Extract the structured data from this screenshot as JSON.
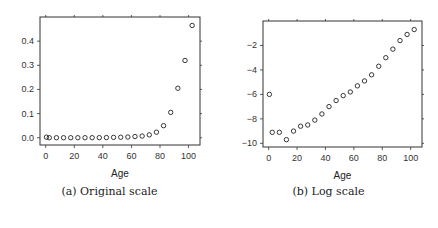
{
  "chart_data": [
    {
      "type": "scatter",
      "title": "",
      "caption": "(a) Original scale",
      "xlabel": "Age",
      "ylabel": "",
      "xlim": [
        -4,
        108
      ],
      "ylim": [
        -0.03,
        0.5
      ],
      "xticks": [
        0,
        20,
        40,
        60,
        80,
        100
      ],
      "yticks": [
        0.0,
        0.1,
        0.2,
        0.3,
        0.4
      ],
      "ytick_labels": [
        "0.0",
        "0.1",
        "0.2",
        "0.3",
        "0.4"
      ],
      "grid": false,
      "marker": "open-circle",
      "series": [
        {
          "name": "rate",
          "x": [
            0.5,
            2.5,
            7.5,
            12.5,
            17.5,
            22.5,
            27.5,
            32.5,
            37.5,
            42.5,
            47.5,
            52.5,
            57.5,
            62.5,
            67.5,
            72.5,
            77.5,
            82.5,
            87.5,
            92.5,
            97.5,
            102.5
          ],
          "y": [
            0.0025,
            0.0001,
            0.0001,
            0.0001,
            0.0001,
            0.0002,
            0.0002,
            0.0003,
            0.0005,
            0.0009,
            0.0015,
            0.0022,
            0.003,
            0.005,
            0.007,
            0.012,
            0.023,
            0.05,
            0.105,
            0.205,
            0.32,
            0.465
          ]
        }
      ]
    },
    {
      "type": "scatter",
      "title": "",
      "caption": "(b) Log scale",
      "xlabel": "Age",
      "ylabel": "",
      "xlim": [
        -4,
        108
      ],
      "ylim": [
        -10.3,
        0.0
      ],
      "xticks": [
        0,
        20,
        40,
        60,
        80,
        100
      ],
      "yticks": [
        -10,
        -8,
        -6,
        -4,
        -2
      ],
      "ytick_labels": [
        "-10",
        "-8",
        "-6",
        "-4",
        "-2"
      ],
      "grid": false,
      "marker": "open-circle",
      "series": [
        {
          "name": "log rate",
          "x": [
            0.5,
            2.5,
            7.5,
            12.5,
            17.5,
            22.5,
            27.5,
            32.5,
            37.5,
            42.5,
            47.5,
            52.5,
            57.5,
            62.5,
            67.5,
            72.5,
            77.5,
            82.5,
            87.5,
            92.5,
            97.5,
            102.5
          ],
          "y": [
            -6.0,
            -9.1,
            -9.1,
            -9.7,
            -9.0,
            -8.6,
            -8.5,
            -8.1,
            -7.6,
            -7.0,
            -6.5,
            -6.1,
            -5.8,
            -5.3,
            -4.9,
            -4.4,
            -3.7,
            -3.0,
            -2.3,
            -1.6,
            -1.1,
            -0.7
          ]
        }
      ]
    }
  ],
  "figure": {
    "caption_a": "(a) Original scale",
    "caption_b": "(b) Log scale",
    "colors": {
      "axis": "#333333",
      "marker": "#222222",
      "background": "#ffffff"
    }
  }
}
